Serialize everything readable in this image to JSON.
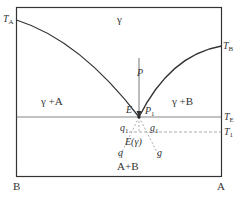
{
  "diagram": {
    "type": "binary eutectic phase diagram",
    "colors": {
      "line": "#333333",
      "thin_line": "#555555",
      "dashed": "#777777",
      "background": "#ffffff"
    },
    "axis_labels": {
      "left_bottom": "B",
      "right_bottom": "A"
    },
    "temperature_labels": {
      "TA": {
        "main": "T",
        "sub": "A"
      },
      "TB": {
        "main": "T",
        "sub": "B"
      },
      "TE": {
        "main": "T",
        "sub": "E"
      },
      "T1": {
        "main": "T",
        "sub": "1"
      }
    },
    "regions": {
      "liquid": "γ",
      "left_two_phase": "γ +A",
      "right_two_phase": "γ +B",
      "solid": "A+B"
    },
    "points": {
      "P": "P",
      "E": "E",
      "P1": {
        "main": "P",
        "sub": "1"
      },
      "q1": {
        "main": "q",
        "sub": "1"
      },
      "g1": {
        "main": "g",
        "sub": "1"
      },
      "q": "q",
      "g": "g",
      "E_gamma": "E(γ)"
    }
  }
}
